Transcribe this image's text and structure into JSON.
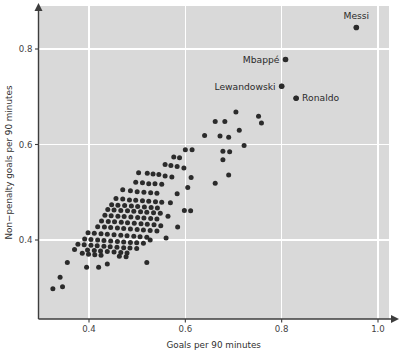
{
  "chart_data": {
    "type": "scatter",
    "title": "",
    "xlabel": "Goals per 90 minutes",
    "ylabel": "Non−penalty goals per 90 minutes",
    "xlim": [
      0.295,
      1.055
    ],
    "ylim": [
      0.285,
      0.885
    ],
    "xticks": [
      0.4,
      0.6,
      0.8,
      1.0
    ],
    "xticklabels": [
      "0.4",
      "0.6",
      "0.8",
      "1.0"
    ],
    "yticks": [
      0.4,
      0.6,
      0.8
    ],
    "yticklabels": [
      "0.4",
      "0.6",
      "0.8"
    ],
    "grid": true,
    "grid_color": "#ffffff",
    "panel_color": "#d9d9d9",
    "point_color": "#2b2b2b",
    "legend": "none",
    "annotations": [
      {
        "label": "Messi",
        "x": 0.955,
        "y": 0.845,
        "position": "above"
      },
      {
        "label": "Mbappé",
        "x": 0.808,
        "y": 0.778,
        "position": "left"
      },
      {
        "label": "Lewandowski",
        "x": 0.8,
        "y": 0.722,
        "position": "left"
      },
      {
        "label": "Ronaldo",
        "x": 0.83,
        "y": 0.697,
        "position": "right"
      }
    ],
    "points": [
      [
        0.955,
        0.845
      ],
      [
        0.808,
        0.778
      ],
      [
        0.8,
        0.722
      ],
      [
        0.83,
        0.697
      ],
      [
        0.705,
        0.668
      ],
      [
        0.752,
        0.659
      ],
      [
        0.662,
        0.648
      ],
      [
        0.682,
        0.648
      ],
      [
        0.758,
        0.645
      ],
      [
        0.712,
        0.63
      ],
      [
        0.64,
        0.619
      ],
      [
        0.672,
        0.618
      ],
      [
        0.69,
        0.615
      ],
      [
        0.722,
        0.598
      ],
      [
        0.6,
        0.589
      ],
      [
        0.614,
        0.589
      ],
      [
        0.678,
        0.586
      ],
      [
        0.692,
        0.585
      ],
      [
        0.576,
        0.574
      ],
      [
        0.588,
        0.572
      ],
      [
        0.678,
        0.568
      ],
      [
        0.558,
        0.558
      ],
      [
        0.57,
        0.556
      ],
      [
        0.583,
        0.554
      ],
      [
        0.597,
        0.551
      ],
      [
        0.503,
        0.541
      ],
      [
        0.521,
        0.54
      ],
      [
        0.533,
        0.538
      ],
      [
        0.545,
        0.537
      ],
      [
        0.558,
        0.534
      ],
      [
        0.572,
        0.532
      ],
      [
        0.612,
        0.531
      ],
      [
        0.69,
        0.536
      ],
      [
        0.662,
        0.519
      ],
      [
        0.497,
        0.521
      ],
      [
        0.511,
        0.52
      ],
      [
        0.524,
        0.518
      ],
      [
        0.537,
        0.518
      ],
      [
        0.551,
        0.517
      ],
      [
        0.605,
        0.51
      ],
      [
        0.47,
        0.505
      ],
      [
        0.486,
        0.503
      ],
      [
        0.5,
        0.501
      ],
      [
        0.514,
        0.5
      ],
      [
        0.528,
        0.499
      ],
      [
        0.541,
        0.498
      ],
      [
        0.583,
        0.497
      ],
      [
        0.456,
        0.487
      ],
      [
        0.47,
        0.486
      ],
      [
        0.484,
        0.484
      ],
      [
        0.497,
        0.483
      ],
      [
        0.511,
        0.482
      ],
      [
        0.524,
        0.481
      ],
      [
        0.538,
        0.48
      ],
      [
        0.551,
        0.479
      ],
      [
        0.569,
        0.478
      ],
      [
        0.447,
        0.474
      ],
      [
        0.46,
        0.473
      ],
      [
        0.474,
        0.472
      ],
      [
        0.488,
        0.471
      ],
      [
        0.501,
        0.47
      ],
      [
        0.515,
        0.469
      ],
      [
        0.529,
        0.468
      ],
      [
        0.542,
        0.467
      ],
      [
        0.598,
        0.462
      ],
      [
        0.611,
        0.461
      ],
      [
        0.439,
        0.464
      ],
      [
        0.452,
        0.463
      ],
      [
        0.466,
        0.462
      ],
      [
        0.48,
        0.461
      ],
      [
        0.493,
        0.46
      ],
      [
        0.507,
        0.459
      ],
      [
        0.52,
        0.458
      ],
      [
        0.534,
        0.457
      ],
      [
        0.548,
        0.456
      ],
      [
        0.564,
        0.45
      ],
      [
        0.433,
        0.452
      ],
      [
        0.446,
        0.451
      ],
      [
        0.46,
        0.45
      ],
      [
        0.473,
        0.449
      ],
      [
        0.487,
        0.448
      ],
      [
        0.501,
        0.447
      ],
      [
        0.514,
        0.446
      ],
      [
        0.528,
        0.445
      ],
      [
        0.541,
        0.444
      ],
      [
        0.426,
        0.44
      ],
      [
        0.44,
        0.439
      ],
      [
        0.453,
        0.438
      ],
      [
        0.467,
        0.437
      ],
      [
        0.48,
        0.436
      ],
      [
        0.494,
        0.435
      ],
      [
        0.508,
        0.434
      ],
      [
        0.521,
        0.433
      ],
      [
        0.535,
        0.432
      ],
      [
        0.549,
        0.43
      ],
      [
        0.584,
        0.427
      ],
      [
        0.418,
        0.428
      ],
      [
        0.432,
        0.427
      ],
      [
        0.445,
        0.426
      ],
      [
        0.459,
        0.425
      ],
      [
        0.472,
        0.424
      ],
      [
        0.486,
        0.423
      ],
      [
        0.5,
        0.422
      ],
      [
        0.513,
        0.421
      ],
      [
        0.527,
        0.42
      ],
      [
        0.541,
        0.419
      ],
      [
        0.398,
        0.415
      ],
      [
        0.411,
        0.414
      ],
      [
        0.425,
        0.413
      ],
      [
        0.438,
        0.412
      ],
      [
        0.452,
        0.411
      ],
      [
        0.466,
        0.41
      ],
      [
        0.479,
        0.409
      ],
      [
        0.493,
        0.408
      ],
      [
        0.506,
        0.407
      ],
      [
        0.52,
        0.406
      ],
      [
        0.56,
        0.404
      ],
      [
        0.391,
        0.402
      ],
      [
        0.404,
        0.401
      ],
      [
        0.418,
        0.4
      ],
      [
        0.431,
        0.399
      ],
      [
        0.445,
        0.398
      ],
      [
        0.459,
        0.397
      ],
      [
        0.472,
        0.396
      ],
      [
        0.486,
        0.395
      ],
      [
        0.499,
        0.394
      ],
      [
        0.513,
        0.393
      ],
      [
        0.527,
        0.4
      ],
      [
        0.377,
        0.391
      ],
      [
        0.39,
        0.39
      ],
      [
        0.404,
        0.389
      ],
      [
        0.417,
        0.388
      ],
      [
        0.431,
        0.387
      ],
      [
        0.444,
        0.386
      ],
      [
        0.458,
        0.385
      ],
      [
        0.472,
        0.384
      ],
      [
        0.485,
        0.383
      ],
      [
        0.499,
        0.382
      ],
      [
        0.37,
        0.38
      ],
      [
        0.397,
        0.379
      ],
      [
        0.411,
        0.378
      ],
      [
        0.424,
        0.377
      ],
      [
        0.438,
        0.376
      ],
      [
        0.452,
        0.375
      ],
      [
        0.466,
        0.374
      ],
      [
        0.479,
        0.373
      ],
      [
        0.463,
        0.366
      ],
      [
        0.477,
        0.365
      ],
      [
        0.425,
        0.368
      ],
      [
        0.412,
        0.369
      ],
      [
        0.399,
        0.37
      ],
      [
        0.386,
        0.372
      ],
      [
        0.355,
        0.353
      ],
      [
        0.52,
        0.353
      ],
      [
        0.395,
        0.343
      ],
      [
        0.42,
        0.343
      ],
      [
        0.438,
        0.35
      ],
      [
        0.34,
        0.322
      ],
      [
        0.345,
        0.302
      ],
      [
        0.325,
        0.298
      ]
    ]
  }
}
